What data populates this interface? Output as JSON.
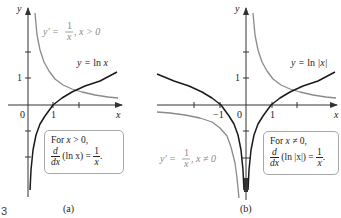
{
  "figure": {
    "number": "3",
    "panels": [
      {
        "id": "a",
        "caption": "(a)",
        "axis_labels": {
          "x": "x",
          "y": "y"
        },
        "tick_labels": {
          "origin": "0",
          "x1": "1",
          "y1": "1"
        },
        "curves": [
          {
            "name": "y = ln x",
            "label_lhs": "y = ",
            "label_fn": "ln ",
            "label_var": "x",
            "color": "#1a1a1a"
          },
          {
            "name": "y' = 1/x, x > 0",
            "label_lhs": "y' = ",
            "label_num": "1",
            "label_den": "x",
            "label_cond": ", x > 0",
            "color": "#8a8a8a"
          }
        ],
        "box": {
          "line1_pre": "For ",
          "line1_var": "x",
          "line1_post": " > 0,",
          "d_num": "d",
          "d_den": "dx",
          "expr": " (ln x) = ",
          "rhs_num": "1",
          "rhs_den": "x",
          "end": "."
        }
      },
      {
        "id": "b",
        "caption": "(b)",
        "axis_labels": {
          "x": "x",
          "y": "y"
        },
        "tick_labels": {
          "origin": "0",
          "x1": "1",
          "xm1": "−1",
          "y1": "1"
        },
        "curves": [
          {
            "name": "y = ln |x|",
            "label_lhs": "y = ",
            "label_fn": "ln ",
            "label_var": "|x|",
            "color": "#1a1a1a"
          },
          {
            "name": "y' = 1/x, x ≠ 0",
            "label_lhs": "y' = ",
            "label_num": "1",
            "label_den": "x",
            "label_cond": ", x ≠ 0",
            "color": "#8a8a8a"
          }
        ],
        "box": {
          "line1_pre": "For ",
          "line1_var": "x",
          "line1_post": " ≠ 0,",
          "d_num": "d",
          "d_den": "dx",
          "expr": " (ln |x|) = ",
          "rhs_num": "1",
          "rhs_den": "x",
          "end": "."
        }
      }
    ]
  },
  "colors": {
    "curve": "#1a1a1a",
    "derivative": "#8a8a8a",
    "axis": "#333333",
    "box_border": "#a8a8a8"
  }
}
